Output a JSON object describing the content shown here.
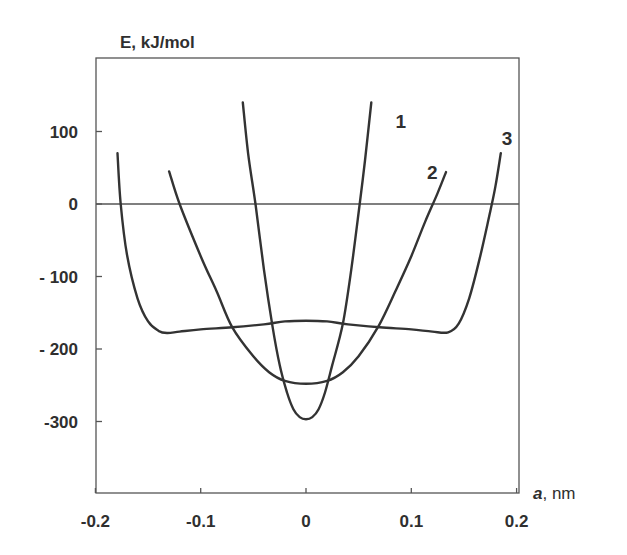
{
  "chart_data": {
    "type": "line",
    "title": "",
    "ylabel": "E, kJ/mol",
    "xlabel_symbol": "a",
    "xlabel_unit": ", nm",
    "xlim": [
      -0.2,
      0.2
    ],
    "ylim": [
      -400,
      200
    ],
    "x_ticks": [
      -0.2,
      -0.1,
      0,
      0.1,
      0.2
    ],
    "x_tick_labels": [
      "-0.2",
      "-0.1",
      "0",
      "0.1",
      "0.2"
    ],
    "y_ticks": [
      100,
      0,
      -100,
      -200,
      -300
    ],
    "y_tick_labels": [
      "100",
      "0",
      "- 100",
      "- 200",
      "-300"
    ],
    "grid": false,
    "reference_line_y": 0,
    "legend": "inline numeric labels",
    "series": [
      {
        "name": "1",
        "label_pos": [
          0.085,
          105
        ],
        "x": [
          -0.06,
          -0.055,
          -0.048,
          -0.04,
          -0.032,
          -0.025,
          -0.018,
          -0.012,
          -0.006,
          0,
          0.006,
          0.012,
          0.018,
          0.025,
          0.035,
          0.043,
          0.051,
          0.056,
          0.062
        ],
        "y": [
          140,
          70,
          0,
          -90,
          -167,
          -222,
          -260,
          -283,
          -294,
          -297,
          -294,
          -283,
          -260,
          -222,
          -165,
          -90,
          0,
          60,
          140
        ]
      },
      {
        "name": "2",
        "label_pos": [
          0.115,
          35
        ],
        "x": [
          -0.13,
          -0.12,
          -0.1,
          -0.085,
          -0.07,
          -0.05,
          -0.035,
          -0.02,
          0,
          0.02,
          0.035,
          0.05,
          0.069,
          0.085,
          0.1,
          0.113,
          0.125,
          0.133
        ],
        "y": [
          45,
          0,
          -72,
          -120,
          -170,
          -210,
          -232,
          -244,
          -248,
          -244,
          -232,
          -210,
          -168,
          -120,
          -72,
          -25,
          15,
          44
        ]
      },
      {
        "name": "3",
        "label_pos": [
          0.186,
          82
        ],
        "x": [
          -0.179,
          -0.176,
          -0.17,
          -0.16,
          -0.15,
          -0.14,
          -0.132,
          -0.12,
          -0.1,
          -0.07,
          -0.04,
          -0.02,
          0,
          0.02,
          0.04,
          0.07,
          0.1,
          0.12,
          0.135,
          0.145,
          0.155,
          0.165,
          0.175,
          0.18,
          0.185
        ],
        "y": [
          70,
          0,
          -70,
          -130,
          -162,
          -175,
          -178,
          -176,
          -173,
          -170,
          -166,
          -162,
          -161,
          -162,
          -166,
          -170,
          -173,
          -176,
          -177,
          -165,
          -130,
          -75,
          -10,
          25,
          70
        ]
      }
    ]
  }
}
